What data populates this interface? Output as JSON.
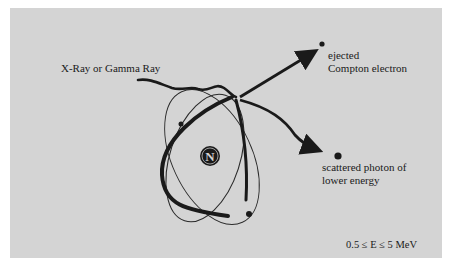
{
  "diagram": {
    "type": "compton-scattering",
    "nucleus_label": "N",
    "labels": {
      "incoming": "X-Ray or Gamma Ray",
      "electron_line1": "ejected",
      "electron_line2": "Compton electron",
      "photon_line1": "scattered photon of",
      "photon_line2": "lower energy",
      "energy_range": "0.5 ≤ E ≤ 5 MeV"
    },
    "colors": {
      "panel": "#d4d4d4",
      "ink": "#1a1a1a",
      "background": "#ffffff"
    }
  }
}
